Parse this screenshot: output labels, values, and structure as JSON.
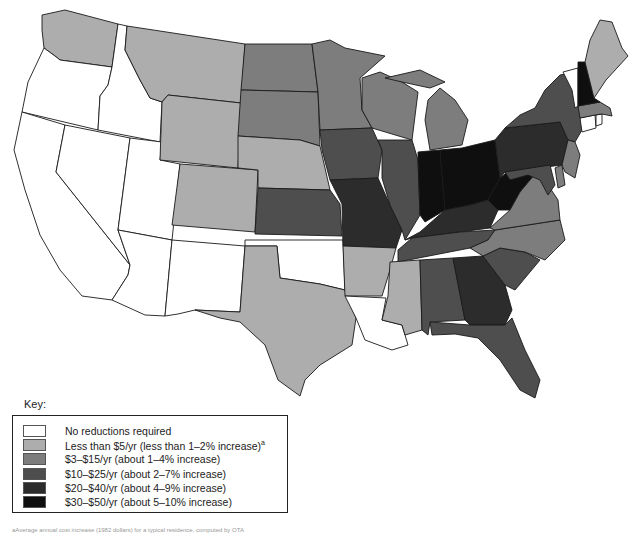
{
  "key": {
    "title": "Key:",
    "items": [
      {
        "id": "none",
        "label": "No reductions required",
        "color": "#ffffff",
        "superscript": ""
      },
      {
        "id": "lt5",
        "label": "Less than $5/yr (less than 1–2% increase)",
        "color": "#adadad",
        "superscript": "a"
      },
      {
        "id": "3_15",
        "label": "$3–$15/yr (about 1–4% increase)",
        "color": "#7d7d7d",
        "superscript": ""
      },
      {
        "id": "10_25",
        "label": "$10–$25/yr (about 2–7% increase)",
        "color": "#4e4e4e",
        "superscript": ""
      },
      {
        "id": "20_40",
        "label": "$20–$40/yr (about 4–9% increase)",
        "color": "#2c2c2c",
        "superscript": ""
      },
      {
        "id": "30_50",
        "label": "$30–$50/yr (about 5–10% increase)",
        "color": "#0f0f0f",
        "superscript": ""
      }
    ]
  },
  "footnote": "aAverage annual cost increase (1982 dollars) for a typical residence, computed by OTA",
  "map": {
    "title": "Contiguous United States — estimated household cost increase by state",
    "states": {
      "WA": "lt5",
      "OR": "none",
      "CA": "none",
      "ID": "none",
      "NV": "none",
      "UT": "none",
      "AZ": "none",
      "MT": "lt5",
      "WY": "lt5",
      "CO": "lt5",
      "NM": "none",
      "ND": "3_15",
      "SD": "3_15",
      "NE": "lt5",
      "KS": "10_25",
      "OK": "none",
      "TX": "lt5",
      "MN": "3_15",
      "IA": "10_25",
      "MO": "20_40",
      "AR": "lt5",
      "LA": "none",
      "WI": "3_15",
      "IL": "10_25",
      "MI": "3_15",
      "IN": "30_50",
      "OH": "30_50",
      "KY": "20_40",
      "TN": "10_25",
      "MS": "lt5",
      "AL": "10_25",
      "GA": "20_40",
      "FL": "10_25",
      "SC": "10_25",
      "NC": "3_15",
      "VA": "3_15",
      "WV": "30_50",
      "PA": "20_40",
      "NY": "10_25",
      "NJ": "3_15",
      "DE": "3_15",
      "MD": "10_25",
      "CT": "none",
      "RI": "none",
      "MA": "3_15",
      "VT": "none",
      "NH": "30_50",
      "ME": "lt5"
    }
  }
}
